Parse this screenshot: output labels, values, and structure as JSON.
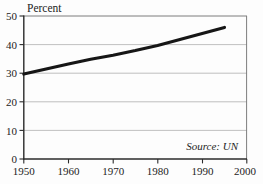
{
  "chart_data": {
    "type": "line",
    "title": "",
    "subtitle": "",
    "xlabel": "",
    "ylabel": "Percent",
    "ylabel_position": "top-left",
    "xlim": [
      1950,
      2000
    ],
    "ylim": [
      0,
      50
    ],
    "grid": true,
    "grid_axis": "y",
    "legend": false,
    "legend_position": "none",
    "annotations": [
      {
        "name": "source-note",
        "text": "Source: UN",
        "style": "italic",
        "x": 1993,
        "y": 3.2,
        "align": "right"
      }
    ],
    "x_ticks": [
      1950,
      1960,
      1970,
      1980,
      1990,
      2000
    ],
    "x_tick_labels": [
      "1950",
      "1960",
      "1970",
      "1980",
      "1990",
      "2000"
    ],
    "y_ticks": [
      0,
      10,
      20,
      30,
      40,
      50
    ],
    "y_tick_labels": [
      "0",
      "10",
      "20",
      "30",
      "40",
      "50"
    ],
    "gridline_values": [
      10,
      20,
      30,
      40
    ],
    "series": [
      {
        "name": "Percent",
        "color": "#161616",
        "line_width": 3.1,
        "x": [
          1950,
          1955,
          1960,
          1965,
          1970,
          1975,
          1980,
          1985,
          1990,
          1995
        ],
        "values": [
          29.7,
          31.5,
          33.2,
          34.9,
          36.3,
          37.9,
          39.7,
          41.8,
          43.9,
          46.0
        ]
      }
    ]
  },
  "axis": {
    "y_label": "Percent",
    "y_tick_0": "0",
    "y_tick_10": "10",
    "y_tick_20": "20",
    "y_tick_30": "30",
    "y_tick_40": "40",
    "y_tick_50": "50",
    "x_tick_1950": "1950",
    "x_tick_1960": "1960",
    "x_tick_1970": "1970",
    "x_tick_1980": "1980",
    "x_tick_1990": "1990",
    "x_tick_2000": "2000"
  },
  "note": {
    "source": "Source: UN"
  },
  "colors": {
    "line": "#161616",
    "grid": "#b9b9b9",
    "axis": "#2b2b2b",
    "frame": "#7d7d7d",
    "background": "#fdfdfd",
    "text": "#232323"
  }
}
